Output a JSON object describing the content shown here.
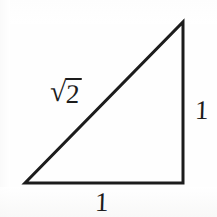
{
  "figure": {
    "kind": "geometry-diagram",
    "background_color": "#fefefe",
    "stroke_color": "#1c1c1c",
    "stroke_width": 3,
    "canvas": {
      "width": 217,
      "height": 217
    }
  },
  "shape": {
    "name": "right-isosceles-triangle",
    "vertices": [
      {
        "id": "bottom-left",
        "x": 25,
        "y": 183
      },
      {
        "id": "bottom-right",
        "x": 183,
        "y": 183
      },
      {
        "id": "top-right",
        "x": 183,
        "y": 22
      }
    ],
    "points_attr": "25,183 183,183 183,22",
    "sides": [
      {
        "id": "horizontal-leg",
        "label": "1"
      },
      {
        "id": "vertical-leg",
        "label": "1"
      },
      {
        "id": "hypotenuse",
        "label": "√2"
      }
    ]
  },
  "labels": {
    "hypotenuse": {
      "radical_sign": "√",
      "radicand": "2",
      "full_text": "√2"
    },
    "vertical_leg": "1",
    "horizontal_leg": "1"
  }
}
